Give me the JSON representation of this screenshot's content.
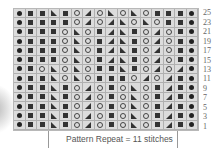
{
  "legend_symbols": {
    "dot": "purl-dot",
    "sq": "knit-square",
    "o": "yarn-over-circle",
    "tr": "decrease-right-triangle",
    "tl": "decrease-left-triangle"
  },
  "row_labels": [
    "25",
    "23",
    "21",
    "19",
    "17",
    "15",
    "13",
    "11",
    "9",
    "7",
    "5",
    "3",
    "1"
  ],
  "rows": [
    [
      "dot",
      "sq",
      "sq",
      "tr",
      "sq",
      "o",
      "tl",
      "o",
      "tr",
      "o",
      "tr",
      "o",
      "sq",
      "sq",
      "sq",
      "dot"
    ],
    [
      "dot",
      "sq",
      "sq",
      "sq",
      "sq",
      "o",
      "tl",
      "o",
      "tl",
      "tr",
      "o",
      "tr",
      "o",
      "sq",
      "sq",
      "dot"
    ],
    [
      "dot",
      "sq",
      "sq",
      "sq",
      "o",
      "tr",
      "o",
      "sq",
      "tl",
      "tr",
      "sq",
      "o",
      "tl",
      "o",
      "sq",
      "dot"
    ],
    [
      "dot",
      "sq",
      "sq",
      "sq",
      "o",
      "tr",
      "o",
      "sq",
      "tl",
      "tr",
      "sq",
      "o",
      "tl",
      "o",
      "sq",
      "dot"
    ],
    [
      "dot",
      "sq",
      "sq",
      "sq",
      "o",
      "tr",
      "o",
      "sq",
      "tl",
      "tr",
      "sq",
      "o",
      "tl",
      "o",
      "sq",
      "dot"
    ],
    [
      "dot",
      "sq",
      "sq",
      "sq",
      "o",
      "tr",
      "o",
      "sq",
      "tl",
      "tr",
      "sq",
      "o",
      "tl",
      "o",
      "sq",
      "dot"
    ],
    [
      "dot",
      "sq",
      "o",
      "tr",
      "o",
      "tr",
      "o",
      "sq",
      "sq",
      "tr",
      "sq",
      "o",
      "tl",
      "o",
      "tl",
      "dot"
    ],
    [
      "dot",
      "sq",
      "sq",
      "tr",
      "o",
      "tr",
      "o",
      "sq",
      "sq",
      "sq",
      "o",
      "tl",
      "o",
      "tl",
      "sq",
      "dot"
    ],
    [
      "dot",
      "sq",
      "sq",
      "tr",
      "sq",
      "o",
      "tl",
      "o",
      "sq",
      "o",
      "tr",
      "o",
      "sq",
      "tl",
      "sq",
      "dot"
    ],
    [
      "dot",
      "sq",
      "sq",
      "tr",
      "sq",
      "o",
      "tl",
      "o",
      "sq",
      "o",
      "tr",
      "o",
      "sq",
      "tl",
      "sq",
      "dot"
    ],
    [
      "dot",
      "sq",
      "sq",
      "tr",
      "sq",
      "o",
      "tl",
      "o",
      "sq",
      "o",
      "tr",
      "o",
      "sq",
      "tl",
      "sq",
      "dot"
    ],
    [
      "dot",
      "sq",
      "sq",
      "tr",
      "sq",
      "o",
      "tl",
      "o",
      "sq",
      "o",
      "tr",
      "o",
      "sq",
      "tl",
      "sq",
      "dot"
    ],
    [
      "dot",
      "sq",
      "sq",
      "tr",
      "sq",
      "o",
      "tl",
      "o",
      "sq",
      "o",
      "tr",
      "o",
      "sq",
      "tl",
      "sq",
      "dot"
    ]
  ],
  "caption": "Pattern Repeat = 11 stitches",
  "colors": {
    "grid_bg": "#dcdcdc",
    "grid_line": "#b0b0b0",
    "symbol": "#333333",
    "text": "#666666"
  }
}
